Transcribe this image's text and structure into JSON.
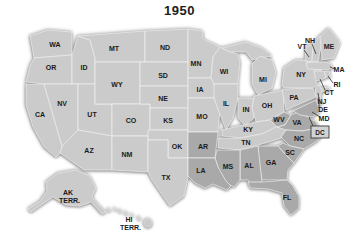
{
  "title": "1950",
  "colors": {
    "background": "#ffffff",
    "state": "#cbcbcb",
    "highlight": "#a9a9a9",
    "border": "#f1f1f1",
    "label": "#1a1a1a",
    "callout_line": "#1a1a1a",
    "dc_box_fill": "#d3d3d3",
    "dc_box_border": "#3a3a3a"
  },
  "map": {
    "states": [
      {
        "abbr": "WA",
        "pts": "30,36 48,30 72,32 72,55 34,58",
        "label": [
          55,
          44
        ],
        "dark": false
      },
      {
        "abbr": "OR",
        "pts": "34,58 72,55 72,84 44,84 26,82 30,66",
        "label": [
          51,
          67
        ],
        "dark": false
      },
      {
        "abbr": "CA",
        "pts": "26,84 44,84 62,146 62,152 56,157 44,147 33,127 26,105",
        "label": [
          40,
          114
        ],
        "dark": false
      },
      {
        "abbr": "ID",
        "pts": "72,55 78,36 90,40 95,58 95,84 72,84",
        "label": [
          84,
          67
        ],
        "dark": false
      },
      {
        "abbr": "NV",
        "pts": "44,84 78,84 78,130 62,146",
        "label": [
          62,
          103
        ],
        "dark": false
      },
      {
        "abbr": "UT",
        "pts": "78,84 95,84 95,104 112,104 112,136 78,130",
        "label": [
          92,
          114
        ],
        "dark": false
      },
      {
        "abbr": "AZ",
        "pts": "78,130 112,136 112,170 84,170 60,153 62,147",
        "label": [
          89,
          150
        ],
        "dark": false
      },
      {
        "abbr": "MT",
        "pts": "78,36 145,31 145,62 95,62 95,58 90,40",
        "label": [
          114,
          48
        ],
        "dark": false
      },
      {
        "abbr": "WY",
        "pts": "95,62 140,62 140,104 95,104",
        "label": [
          117,
          84
        ],
        "dark": false
      },
      {
        "abbr": "CO",
        "pts": "112,104 150,104 150,136 112,136",
        "label": [
          131,
          120
        ],
        "dark": false
      },
      {
        "abbr": "NM",
        "pts": "112,136 148,136 148,172 112,170",
        "label": [
          127,
          154
        ],
        "dark": false
      },
      {
        "abbr": "ND",
        "pts": "145,31 188,29 188,62 145,62",
        "label": [
          165,
          47
        ],
        "dark": false
      },
      {
        "abbr": "SD",
        "pts": "140,62 188,62 188,86 140,86",
        "label": [
          163,
          75
        ],
        "dark": false
      },
      {
        "abbr": "NE",
        "pts": "140,86 188,86 188,108 150,108 150,104 140,104",
        "label": [
          163,
          98
        ],
        "dark": false
      },
      {
        "abbr": "KS",
        "pts": "150,108 188,108 188,130 150,130",
        "label": [
          168,
          120
        ],
        "dark": false
      },
      {
        "abbr": "OK",
        "pts": "148,130 188,130 188,158 168,158 168,140 148,140",
        "label": [
          177,
          146
        ],
        "dark": false
      },
      {
        "abbr": "TX",
        "pts": "148,140 168,140 168,158 188,158 188,178 184,196 170,206 163,196 152,180 148,172",
        "label": [
          166,
          177
        ],
        "dark": false
      },
      {
        "abbr": "MN",
        "pts": "188,29 203,31 203,39 220,47 213,57 211,78 188,78",
        "label": [
          196,
          63
        ],
        "dark": false
      },
      {
        "abbr": "IA",
        "pts": "188,78 211,78 216,86 214,98 188,98",
        "label": [
          200,
          89
        ],
        "dark": false
      },
      {
        "abbr": "MO",
        "pts": "188,98 214,98 220,110 218,132 188,132",
        "label": [
          202,
          116
        ],
        "dark": false
      },
      {
        "abbr": "WI",
        "pts": "213,57 220,47 226,50 238,54 240,62 238,84 214,84 211,78",
        "label": [
          224,
          71
        ],
        "dark": false
      },
      {
        "abbr": "IL",
        "pts": "214,84 238,84 238,98 233,118 226,130 219,112 214,98",
        "label": [
          226,
          103
        ],
        "dark": false
      },
      {
        "abbr": "IN",
        "pts": "238,98 254,98 254,118 245,126 238,118",
        "label": [
          246,
          109
        ],
        "dark": false
      },
      {
        "abbr": null,
        "id": "michigan-upper-peninsula",
        "pts": "222,48 246,42 262,48 272,56 262,58 252,60 246,52 238,52 230,52",
        "label": null,
        "dark": false
      },
      {
        "abbr": "MI",
        "pts": "252,64 260,56 272,60 276,72 272,88 258,95 252,84",
        "label": [
          263,
          79
        ],
        "dark": false
      },
      {
        "abbr": "OH",
        "pts": "254,96 284,90 284,112 270,120 256,122 252,108",
        "label": [
          267,
          105
        ],
        "dark": false
      },
      {
        "abbr": "KY",
        "pts": "222,130 256,122 270,120 278,126 262,134 240,138 222,136",
        "label": [
          248,
          129
        ],
        "dark": false
      },
      {
        "abbr": "TN",
        "pts": "218,138 240,138 262,134 278,126 288,130 288,136 262,144 240,150 218,148",
        "label": [
          246,
          142
        ],
        "dark": false
      },
      {
        "abbr": "PA",
        "pts": "282,89 313,88 316,97 286,110",
        "label": [
          294,
          97
        ],
        "dark": false
      },
      {
        "abbr": "NY",
        "pts": "282,86 284,68 296,60 310,60 312,68 320,67 322,72 314,78 318,85 313,88 284,88",
        "label": [
          301,
          74
        ],
        "dark": false
      },
      {
        "abbr": null,
        "id": "long-island",
        "pts": "315,89 328,87 331,90 317,93",
        "label": null,
        "dark": false
      },
      {
        "abbr": "VT",
        "pts": "306,47 313,44 312,62 305,61",
        "label": null,
        "dark": false
      },
      {
        "abbr": "NH",
        "pts": "313,44 320,36 322,42 318,62 312,62",
        "label": null,
        "dark": false
      },
      {
        "abbr": "ME",
        "pts": "320,36 329,28 340,42 334,58 322,60",
        "label": [
          329,
          46
        ],
        "dark": false
      },
      {
        "abbr": "MA",
        "pts": "306,63 312,62 326,62 331,64 333,68 327,70 308,69",
        "label": null,
        "dark": false
      },
      {
        "abbr": "RI",
        "pts": "324,71 329,71 331,77 326,77",
        "label": null,
        "dark": false
      },
      {
        "abbr": "CT",
        "pts": "314,71 324,71 326,78 316,81",
        "label": null,
        "dark": false
      },
      {
        "abbr": "NJ",
        "pts": "315,88 319,85 322,90 320,99 316,96",
        "label": null,
        "dark": false
      },
      {
        "abbr": "WV",
        "pts": "270,120 284,112 291,115 285,125 277,127",
        "label": [
          279,
          119
        ],
        "dark": true
      },
      {
        "abbr": "VA",
        "pts": "277,127 285,125 291,115 298,112 306,116 316,122 319,128 302,131 286,130",
        "label": [
          297,
          122
        ],
        "dark": true
      },
      {
        "abbr": "MD",
        "pts": "293,111 316,100 318,105 320,112 312,117 300,115",
        "label": null,
        "dark": true
      },
      {
        "abbr": "DE",
        "pts": "316,98 320,96 322,104 318,105",
        "label": null,
        "dark": true
      },
      {
        "abbr": "NC",
        "pts": "286,130 302,131 319,128 324,133 317,141 304,149 290,146 281,137",
        "label": [
          299,
          138
        ],
        "dark": true
      },
      {
        "abbr": "SC",
        "pts": "283,143 290,146 304,149 294,163 283,152 278,146",
        "label": [
          290,
          152
        ],
        "dark": true
      },
      {
        "abbr": "GA",
        "pts": "258,146 278,146 283,152 294,163 288,170 287,180 262,180 259,162",
        "label": [
          271,
          162
        ],
        "dark": true
      },
      {
        "abbr": "AL",
        "pts": "240,150 258,146 262,182 252,186 248,180 240,180",
        "label": [
          249,
          165
        ],
        "dark": true
      },
      {
        "abbr": "MS",
        "pts": "217,150 240,150 240,180 234,187 224,182 218,168 215,158",
        "label": [
          228,
          166
        ],
        "dark": true
      },
      {
        "abbr": "AR",
        "pts": "188,132 218,132 215,158 188,158",
        "label": [
          203,
          146
        ],
        "dark": true
      },
      {
        "abbr": "LA",
        "pts": "188,158 215,158 218,167 226,181 231,186 227,190 213,184 205,188 195,183 188,176",
        "label": [
          201,
          170
        ],
        "dark": true
      },
      {
        "abbr": "FL",
        "pts": "248,182 262,182 287,180 293,186 299,197 299,208 291,215 284,206 282,193 268,189 250,188",
        "label": [
          287,
          197
        ],
        "dark": true
      }
    ],
    "callouts": [
      {
        "abbr": "VT",
        "label": [
          302,
          46
        ],
        "line": [
          304,
          50,
          309,
          57
        ]
      },
      {
        "abbr": "NH",
        "label": [
          310,
          40
        ],
        "line": [
          312,
          44,
          316,
          54
        ]
      },
      {
        "abbr": "MA",
        "label": [
          339,
          69
        ],
        "line": [
          335,
          69,
          330,
          67
        ]
      },
      {
        "abbr": "RI",
        "label": [
          337,
          84
        ],
        "line": [
          333,
          83,
          328,
          76
        ]
      },
      {
        "abbr": "CT",
        "label": [
          329,
          92
        ],
        "line": [
          325,
          90,
          320,
          79
        ]
      },
      {
        "abbr": "NJ",
        "label": [
          322,
          101
        ],
        "line": [
          319,
          99,
          318,
          93
        ]
      },
      {
        "abbr": "DE",
        "label": [
          323,
          109
        ],
        "line": [
          319,
          108,
          319,
          102
        ]
      },
      {
        "abbr": "MD",
        "label": [
          324,
          118
        ],
        "line": [
          320,
          117,
          312,
          112
        ]
      }
    ],
    "dc": {
      "label": "DC",
      "box": [
        311,
        126,
        18,
        12
      ],
      "line": [
        313,
        126,
        309,
        117
      ]
    },
    "territories": [
      {
        "id": "alaska-territory",
        "label_lines": [
          "AK",
          "TERR."
        ],
        "label": [
          68,
          192
        ],
        "pts": "46,182 58,173 76,170 90,176 96,188 92,197 99,205 106,212 102,214 91,202 80,206 66,205 53,197 44,203 31,212 28,209 40,201 47,191"
      },
      {
        "id": "hawaii-territory",
        "label_lines": [
          "HI",
          "TERR."
        ],
        "label": [
          129,
          219
        ],
        "islands": [
          [
            109,
            210,
            1.6
          ],
          [
            115,
            209,
            1.2
          ],
          [
            120,
            211,
            1.4
          ],
          [
            126,
            213,
            1.5
          ],
          [
            132,
            215,
            1.3
          ],
          [
            139,
            218,
            1.6
          ],
          [
            148,
            223,
            4.2
          ]
        ]
      }
    ]
  }
}
